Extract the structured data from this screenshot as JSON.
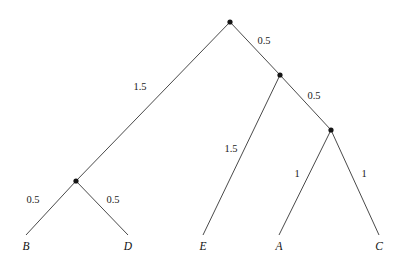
{
  "figure": {
    "width": 403,
    "height": 268,
    "background_color": "#ffffff",
    "line_color": "#4a4a4a",
    "node_color": "#151515",
    "text_color": "#1a1a1a"
  },
  "chart_data": {
    "type": "diagram",
    "subtype": "phylogenetic-tree",
    "title": "",
    "xlabel": "",
    "ylabel": "",
    "grid": false,
    "legend": "none",
    "nodes": [
      {
        "id": "root",
        "label": "",
        "kind": "internal",
        "x": 230,
        "y": 22,
        "dot": true
      },
      {
        "id": "n_bd",
        "label": "",
        "kind": "internal",
        "x": 76,
        "y": 181,
        "dot": true
      },
      {
        "id": "n2",
        "label": "",
        "kind": "internal",
        "x": 280,
        "y": 75,
        "dot": true
      },
      {
        "id": "n3",
        "label": "",
        "kind": "internal",
        "x": 331,
        "y": 130,
        "dot": true
      },
      {
        "id": "leaf_B",
        "label": "B",
        "kind": "leaf",
        "x": 26,
        "y": 235,
        "dot": false
      },
      {
        "id": "leaf_D",
        "label": "D",
        "kind": "leaf",
        "x": 128,
        "y": 235,
        "dot": false
      },
      {
        "id": "leaf_E",
        "label": "E",
        "kind": "leaf",
        "x": 203,
        "y": 235,
        "dot": false
      },
      {
        "id": "leaf_A",
        "label": "A",
        "kind": "leaf",
        "x": 279,
        "y": 235,
        "dot": false
      },
      {
        "id": "leaf_C",
        "label": "C",
        "kind": "leaf",
        "x": 379,
        "y": 235,
        "dot": false
      }
    ],
    "edges": [
      {
        "id": "e_root_nbd",
        "from": "root",
        "to": "n_bd",
        "weight": "1.5",
        "label_x": 140,
        "label_y": 88
      },
      {
        "id": "e_root_n2",
        "from": "root",
        "to": "n2",
        "weight": "0.5",
        "label_x": 264,
        "label_y": 42
      },
      {
        "id": "e_n2_E",
        "from": "n2",
        "to": "leaf_E",
        "weight": "1.5",
        "label_x": 231,
        "label_y": 150
      },
      {
        "id": "e_n2_n3",
        "from": "n2",
        "to": "n3",
        "weight": "0.5",
        "label_x": 314,
        "label_y": 97
      },
      {
        "id": "e_n3_A",
        "from": "n3",
        "to": "leaf_A",
        "weight": "1",
        "label_x": 297,
        "label_y": 175
      },
      {
        "id": "e_n3_C",
        "from": "n3",
        "to": "leaf_C",
        "weight": "1",
        "label_x": 364,
        "label_y": 175
      },
      {
        "id": "e_nbd_B",
        "from": "n_bd",
        "to": "leaf_B",
        "weight": "0.5",
        "label_x": 33,
        "label_y": 201
      },
      {
        "id": "e_nbd_D",
        "from": "n_bd",
        "to": "leaf_D",
        "weight": "0.5",
        "label_x": 113,
        "label_y": 201
      }
    ],
    "leaf_labels": [
      {
        "id": "leaf_label_B",
        "text": "B",
        "x": 26,
        "y": 250
      },
      {
        "id": "leaf_label_D",
        "text": "D",
        "x": 128,
        "y": 250
      },
      {
        "id": "leaf_label_E",
        "text": "E",
        "x": 203,
        "y": 250
      },
      {
        "id": "leaf_label_A",
        "text": "A",
        "x": 279,
        "y": 250
      },
      {
        "id": "leaf_label_C",
        "text": "C",
        "x": 379,
        "y": 250
      }
    ],
    "taxa": [
      "B",
      "D",
      "E",
      "A",
      "C"
    ],
    "branch_lengths": {
      "root_to_BD_clade": 1.5,
      "root_to_inner_node": 0.5,
      "inner_node_to_E": 1.5,
      "inner_node_to_AC_clade": 0.5,
      "AC_clade_to_A": 1,
      "AC_clade_to_C": 1,
      "BD_clade_to_B": 0.5,
      "BD_clade_to_D": 0.5
    }
  }
}
